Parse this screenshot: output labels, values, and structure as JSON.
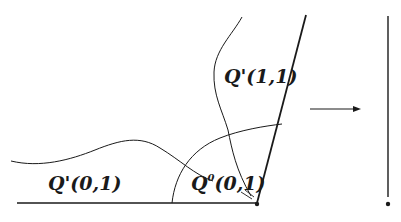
{
  "diagram": {
    "labels": {
      "q1_11": "Q'(1,1)",
      "q1_01": "Q'(0,1)",
      "q0_01_base": "Q",
      "q0_01_sup": "0",
      "q0_01_rest": "(0,1)"
    },
    "colors": {
      "stroke": "#1a1a1a",
      "background": "#ffffff"
    }
  }
}
